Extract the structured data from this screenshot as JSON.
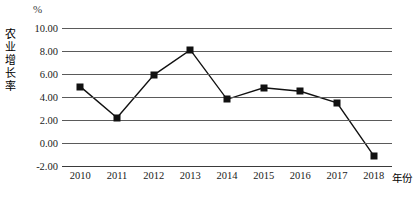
{
  "chart_data": {
    "type": "line",
    "title": "",
    "unit_label": "%",
    "xlabel": "年份",
    "ylabel": "农业增长率",
    "categories": [
      "2010",
      "2011",
      "2012",
      "2013",
      "2014",
      "2015",
      "2016",
      "2017",
      "2018"
    ],
    "values": [
      4.9,
      2.2,
      5.9,
      8.1,
      3.8,
      4.8,
      4.5,
      3.5,
      -1.1
    ],
    "series": [
      {
        "name": "农业增长率",
        "values": [
          4.9,
          2.2,
          5.9,
          8.1,
          3.8,
          4.8,
          4.5,
          3.5,
          -1.1
        ]
      }
    ],
    "ylim": [
      -2.0,
      10.0
    ],
    "ytick_labels": [
      "10.00",
      "8.00",
      "6.00",
      "4.00",
      "2.00",
      "0.00",
      "-2.00"
    ],
    "ytick_values": [
      10.0,
      8.0,
      6.0,
      4.0,
      2.0,
      0.0,
      -2.0
    ],
    "grid": true,
    "legend": "none",
    "marker": "square",
    "line_color": "#111111",
    "marker_color": "#111111",
    "grid_color": "#5a5a5a"
  },
  "caption": {
    "text": ""
  }
}
